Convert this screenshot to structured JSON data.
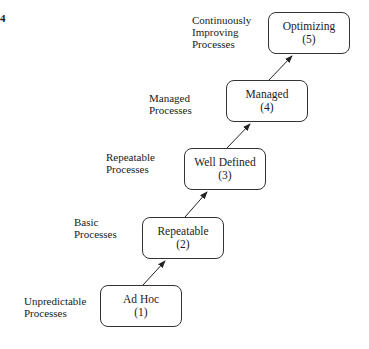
{
  "figure": {
    "number": "4"
  },
  "levels": [
    {
      "name": "Ad Hoc",
      "level": "(1)",
      "description_line1": "Unpredictable",
      "description_line2": "Processes"
    },
    {
      "name": "Repeatable",
      "level": "(2)",
      "description_line1": "Basic",
      "description_line2": "Processes"
    },
    {
      "name": "Well Defined",
      "level": "(3)",
      "description_line1": "Repeatable",
      "description_line2": "Processes"
    },
    {
      "name": "Managed",
      "level": "(4)",
      "description_line1": "Managed",
      "description_line2": "Processes"
    },
    {
      "name": "Optimizing",
      "level": "(5)",
      "description_line1": "Continuously",
      "description_line2": "Improving",
      "description_line3": "Processes"
    }
  ],
  "colors": {
    "line": "#333333",
    "text": "#1a1a1a",
    "background": "#ffffff"
  }
}
